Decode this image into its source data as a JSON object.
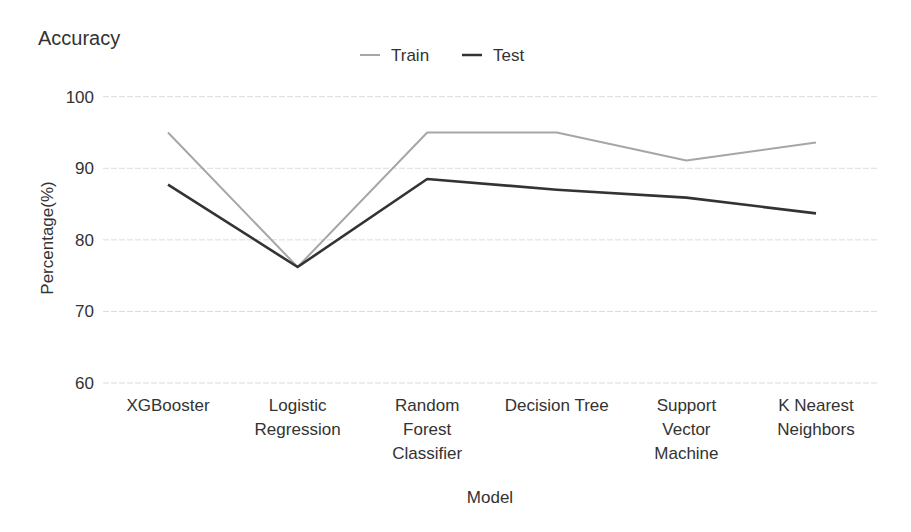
{
  "chart_data": {
    "type": "line",
    "title": "Accuracy",
    "xlabel": "Model",
    "ylabel": "Percentage(%)",
    "ylim": [
      60,
      100
    ],
    "yticks": [
      60,
      70,
      80,
      90,
      100
    ],
    "grid": true,
    "legend_position": "top-center",
    "categories": [
      "XGBooster",
      "Logistic Regression",
      "Random Forest Classifier",
      "Decision Tree",
      "Support Vector Machine",
      "K Nearest Neighbors"
    ],
    "category_lines": [
      [
        "XGBooster"
      ],
      [
        "Logistic",
        "Regression"
      ],
      [
        "Random",
        "Forest",
        "Classifier"
      ],
      [
        "Decision Tree"
      ],
      [
        "Support",
        "Vector",
        "Machine"
      ],
      [
        "K Nearest",
        "Neighbors"
      ]
    ],
    "series": [
      {
        "name": "Train",
        "color": "#a6a6a6",
        "values": [
          95.0,
          76.2,
          95.0,
          95.0,
          91.1,
          93.6
        ]
      },
      {
        "name": "Test",
        "color": "#333333",
        "values": [
          87.7,
          76.2,
          88.5,
          87.0,
          85.9,
          83.7
        ]
      }
    ]
  }
}
